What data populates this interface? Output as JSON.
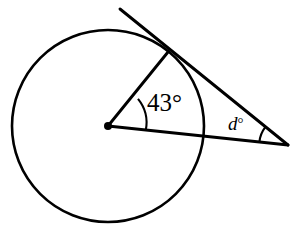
{
  "figure": {
    "type": "geometry-diagram",
    "stroke_color": "#000000",
    "background_color": "#ffffff",
    "fill_color": "none",
    "stroke_width": 2.6
  },
  "circle": {
    "name": "circle",
    "center_x": 108,
    "center_y": 126,
    "radius": 96
  },
  "points": {
    "center": {
      "name": "center-point",
      "x": 108,
      "y": 126,
      "dot_radius": 4
    },
    "tangent_point": {
      "name": "tangent-point",
      "x": 168,
      "y": 52
    },
    "external_vertex": {
      "name": "external-vertex",
      "x": 288,
      "y": 145
    },
    "tangent_line_end": {
      "name": "tangent-line-upper-end",
      "x": 120,
      "y": 9
    }
  },
  "segments": [
    {
      "name": "radius-to-tangent-point",
      "x1": 108,
      "y1": 126,
      "x2": 168,
      "y2": 52
    },
    {
      "name": "tangent-line",
      "x1": 120,
      "y1": 9,
      "x2": 288,
      "y2": 145
    },
    {
      "name": "secant-through-center",
      "x1": 108,
      "y1": 126,
      "x2": 288,
      "y2": 145
    }
  ],
  "arcs": [
    {
      "name": "center-angle-arc",
      "cx": 108,
      "cy": 126,
      "radius": 38,
      "start_x": 138.0,
      "start_y": 98.8,
      "end_x": 145.8,
      "end_y": 130.0
    },
    {
      "name": "vertex-angle-arc",
      "cx": 288,
      "cy": 145,
      "radius": 29,
      "start_x": 259.4,
      "start_y": 141.9,
      "end_x": 265.3,
      "end_y": 127.2
    }
  ],
  "labels": {
    "center_angle": {
      "name": "center-angle-label",
      "value": "43",
      "degree_symbol": "°",
      "text": "43°"
    },
    "vertex_angle": {
      "name": "vertex-angle-label",
      "variable": "d",
      "degree_symbol": "°",
      "text": "d°"
    }
  }
}
